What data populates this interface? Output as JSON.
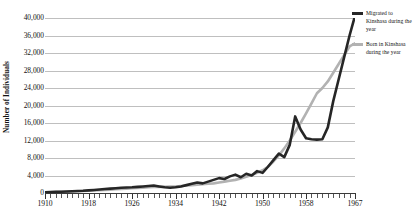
{
  "chart_data": {
    "type": "line",
    "title": "",
    "xlabel": "",
    "ylabel": "Number of Individuals",
    "xlim": [
      1910,
      1967
    ],
    "ylim": [
      0,
      40000
    ],
    "ytick_step": 4000,
    "grid": true,
    "legend_position": "right",
    "ytick_labels": [
      "40,000",
      "36,000",
      "32,000",
      "28,000",
      "24,000",
      "20,000",
      "16,000",
      "12,000",
      "8,000",
      "4,000",
      "0"
    ],
    "ytick_values": [
      40000,
      36000,
      32000,
      28000,
      24000,
      20000,
      16000,
      12000,
      8000,
      4000,
      0
    ],
    "xtick_labels": [
      "1910",
      "1918",
      "1926",
      "1934",
      "1942",
      "1950",
      "1958",
      "1967"
    ],
    "xtick_values": [
      1910,
      1918,
      1926,
      1934,
      1942,
      1950,
      1958,
      1967
    ],
    "x": [
      1910,
      1911,
      1912,
      1913,
      1914,
      1915,
      1916,
      1917,
      1918,
      1919,
      1920,
      1921,
      1922,
      1923,
      1924,
      1925,
      1926,
      1927,
      1928,
      1929,
      1930,
      1931,
      1932,
      1933,
      1934,
      1935,
      1936,
      1937,
      1938,
      1939,
      1940,
      1941,
      1942,
      1943,
      1944,
      1945,
      1946,
      1947,
      1948,
      1949,
      1950,
      1951,
      1952,
      1953,
      1954,
      1955,
      1956,
      1957,
      1958,
      1959,
      1960,
      1961,
      1962,
      1963,
      1964,
      1965,
      1966,
      1967
    ],
    "series": [
      {
        "name": "Migrated to Kinshasa during the year",
        "color": "#262626",
        "values": [
          150,
          200,
          250,
          300,
          350,
          400,
          450,
          500,
          600,
          700,
          800,
          900,
          1000,
          1100,
          1200,
          1250,
          1300,
          1400,
          1500,
          1600,
          1700,
          1500,
          1300,
          1200,
          1300,
          1500,
          1800,
          2100,
          2400,
          2200,
          2600,
          3000,
          3400,
          3200,
          3800,
          4200,
          3600,
          4400,
          4000,
          5000,
          4600,
          6000,
          7500,
          9000,
          8200,
          11000,
          17500,
          14500,
          12500,
          12300,
          12200,
          12300,
          15000,
          21000,
          26000,
          31000,
          36000,
          40500
        ]
      },
      {
        "name": "Born in Kinshasa during the year",
        "color": "#b2b2b2",
        "values": [
          120,
          160,
          200,
          250,
          300,
          350,
          400,
          450,
          500,
          560,
          620,
          700,
          780,
          860,
          940,
          1000,
          1080,
          1150,
          1220,
          1300,
          1380,
          1400,
          1420,
          1450,
          1500,
          1600,
          1700,
          1800,
          1900,
          2000,
          2100,
          2200,
          2400,
          2600,
          2800,
          3000,
          3300,
          3700,
          4100,
          4600,
          5200,
          6000,
          7200,
          8600,
          10200,
          12000,
          14000,
          16000,
          18200,
          20500,
          22800,
          24000,
          25500,
          27500,
          29500,
          31500,
          33500,
          34200
        ]
      }
    ]
  },
  "legend": {
    "items": [
      {
        "label": "Migrated to Kinshasa during the year",
        "color": "#262626"
      },
      {
        "label": "Born in Kinshasa during the year",
        "color": "#b2b2b2"
      }
    ]
  }
}
